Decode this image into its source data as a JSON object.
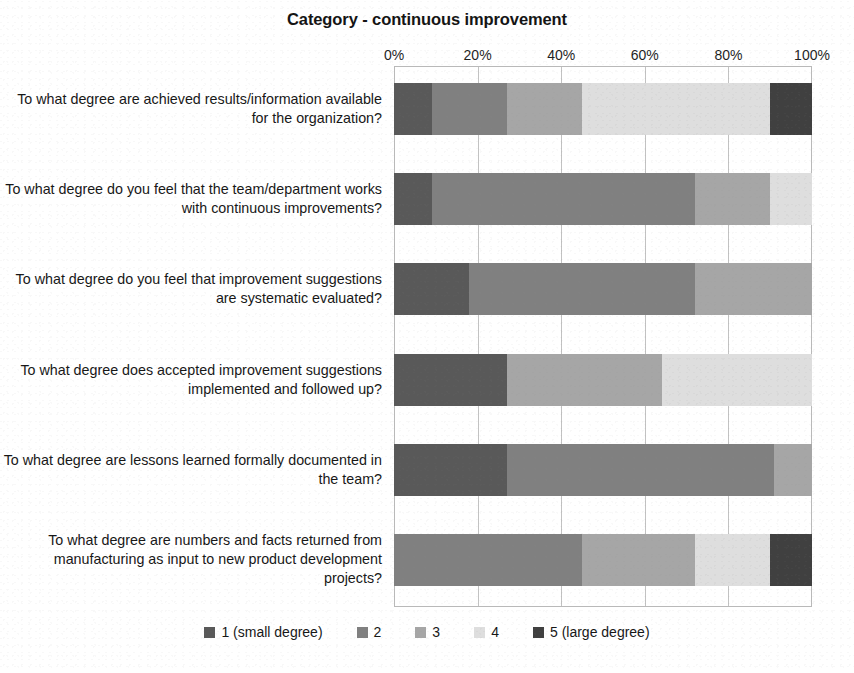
{
  "chart_data": {
    "type": "bar",
    "subtype": "stacked-horizontal-100-percent",
    "title": "Category - continuous improvement",
    "xlabel": "",
    "ylabel": "",
    "xlim": [
      0,
      100
    ],
    "xticks": [
      "0%",
      "20%",
      "40%",
      "60%",
      "80%",
      "100%"
    ],
    "xtick_values": [
      0,
      20,
      40,
      60,
      80,
      100
    ],
    "grid": true,
    "grid_axis": "x",
    "legend_position": "bottom",
    "categories": [
      "To what degree are achieved results/information available for the organization?",
      "To what degree do you feel that the team/department works with continuous improvements?",
      "To what degree do you feel that improvement suggestions are systematic evaluated?",
      "To what degree does accepted improvement suggestions implemented and followed up?",
      "To what degree are lessons learned formally documented in the team?",
      "To what degree are numbers and facts returned from manufacturing as input to new product development projects?"
    ],
    "series": [
      {
        "name": "1 (small degree)",
        "color": "#595959",
        "values": [
          9,
          9,
          18,
          27,
          27,
          0
        ]
      },
      {
        "name": "2",
        "color": "#808080",
        "values": [
          18,
          63,
          54,
          0,
          64,
          45
        ]
      },
      {
        "name": "3",
        "color": "#a6a6a6",
        "values": [
          18,
          18,
          28,
          37,
          9,
          27
        ]
      },
      {
        "name": "4",
        "color": "#dedede",
        "values": [
          45,
          10,
          0,
          36,
          0,
          18
        ]
      },
      {
        "name": "5 (large degree)",
        "color": "#404040",
        "values": [
          10,
          0,
          0,
          0,
          0,
          10
        ]
      }
    ]
  },
  "legend": {
    "items": [
      {
        "label": "1 (small degree)",
        "color": "#595959"
      },
      {
        "label": "2",
        "color": "#808080"
      },
      {
        "label": "3",
        "color": "#a6a6a6"
      },
      {
        "label": "4",
        "color": "#dedede"
      },
      {
        "label": "5 (large degree)",
        "color": "#404040"
      }
    ]
  },
  "colors": {
    "series_1": "#595959",
    "series_2": "#808080",
    "series_3": "#a6a6a6",
    "series_4": "#dedede",
    "series_5": "#404040",
    "gridline": "#c2c2c2",
    "text": "#171717",
    "background": "#ffffff"
  }
}
